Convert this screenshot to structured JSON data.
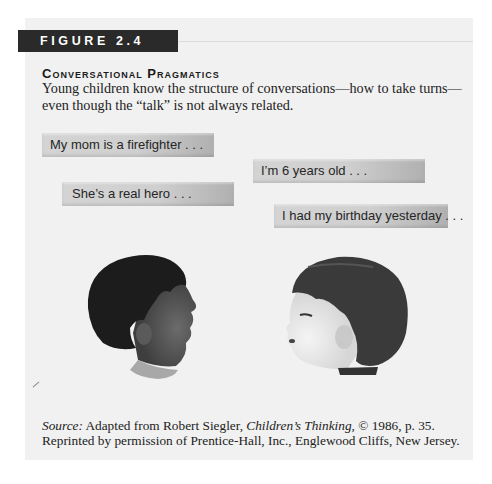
{
  "figure": {
    "label": "FIGURE 2.4",
    "title": "Conversational Pragmatics",
    "description": "Young children know the structure of conversations—how to take turns—even though the “talk” is not always related."
  },
  "speech_bubbles": [
    {
      "speaker": "left-child",
      "text": "My mom is a firefighter . . ."
    },
    {
      "speaker": "right-child",
      "text": "I’m 6 years old . . ."
    },
    {
      "speaker": "left-child",
      "text": "She’s a real hero . . ."
    },
    {
      "speaker": "right-child",
      "text": "I had my birthday yesterday . . ."
    }
  ],
  "images": {
    "left": "child-profile-facing-right",
    "right": "child-profile-facing-left"
  },
  "source": {
    "label": "Source:",
    "text_1": " Adapted from Robert Siegler, ",
    "book_title": "Children’s Thinking",
    "text_2": ", © 1986, p. 35.",
    "line_2": "Reprinted by permission of Prentice-Hall, Inc., Englewood Cliffs, New Jersey."
  },
  "colors": {
    "panel": "#f1f1f1",
    "label_bar": "#2a2a2a",
    "bubble": "#cfcfcf"
  }
}
